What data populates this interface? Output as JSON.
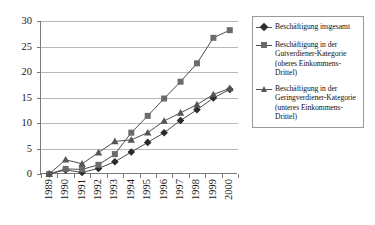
{
  "chart_data": {
    "type": "line",
    "title": "",
    "xlabel": "",
    "ylabel": "",
    "categories": [
      "1989",
      "1990",
      "1991",
      "1992",
      "1993",
      "1994",
      "1995",
      "1996",
      "1997",
      "1998",
      "1999",
      "2000"
    ],
    "ylim": [
      0,
      30
    ],
    "yticks": [
      0,
      5,
      10,
      15,
      20,
      25,
      30
    ],
    "grid": true,
    "legend_position": "right",
    "series": [
      {
        "name": "Beschäftigung insgesamt",
        "marker": "diamond",
        "color": "#2b2b2b",
        "values": [
          0,
          0.8,
          0.3,
          1.1,
          2.4,
          4.3,
          6.2,
          8.1,
          10.5,
          12.6,
          14.9,
          16.6
        ]
      },
      {
        "name": "Beschäftigung in der Gutverdiener-Kategorie (oberes Einkommens-Drittel)",
        "marker": "square",
        "color": "#6b6b6b",
        "values": [
          0,
          1.0,
          0.9,
          1.8,
          3.9,
          8.1,
          11.4,
          14.8,
          18.1,
          21.7,
          26.7,
          28.2
        ]
      },
      {
        "name": "Beschäftigung in der Geringverdiener-Kategorie (unteres Einkommens-Drittel)",
        "marker": "triangle",
        "color": "#555555",
        "values": [
          0,
          2.8,
          2.0,
          4.2,
          6.4,
          6.7,
          8.1,
          10.4,
          12.0,
          13.6,
          15.6,
          16.8
        ]
      }
    ]
  },
  "legend": {
    "entries": [
      {
        "label": "Beschäftigung insgesamt"
      },
      {
        "label": "Beschäftigung in der Gutverdiener-Kategorie (oberes Einkommens-Drittel)"
      },
      {
        "label": "Beschäftigung in der Geringverdiener-Kategorie (unteres Einkommens-Drittel)"
      }
    ]
  }
}
